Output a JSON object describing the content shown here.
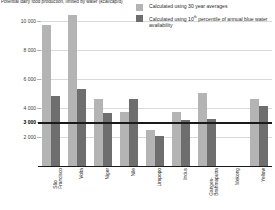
{
  "chart_data": {
    "type": "bar",
    "title": "Potential dairy food production, limited by water (kcal/cap/d)",
    "xlabel": "",
    "ylabel": "",
    "ylim": [
      0,
      10400
    ],
    "grid": true,
    "legend_position": "top-right",
    "emphasis_line": {
      "value": 3000,
      "label": "3 000"
    },
    "ytick_labels": [
      "10 000",
      "8 000",
      "6 000",
      "4 000",
      "3 000",
      "2 000"
    ],
    "ytick_values": [
      10000,
      8000,
      6000,
      4000,
      3000,
      2000
    ],
    "categories": [
      "São\nFrancisco",
      "Volta",
      "Niger",
      "Nile",
      "Limpopo",
      "Indus",
      "Ganges-\nBrahmaputra",
      "Mekong",
      "Yellow"
    ],
    "series": [
      {
        "name": "Calculated using 30 year averages",
        "color": "#b4b4b4",
        "values": [
          9700,
          11200,
          4600,
          3750,
          2450,
          3700,
          5000,
          0,
          4650
        ]
      },
      {
        "name": "Calculated using 10th percentile of annual blue water availability",
        "color": "#6e6e6e",
        "values": [
          4800,
          5300,
          3650,
          4650,
          2050,
          3150,
          3250,
          0,
          4150
        ]
      }
    ]
  },
  "legend": {
    "items": [
      {
        "label": "Calculated using 30 year averages",
        "color": "#b4b4b4"
      },
      {
        "label_pre": "Calculated using 10",
        "label_sup": "th",
        "label_post": " percentile of annual blue water availability",
        "color": "#6e6e6e"
      }
    ]
  },
  "colors": {
    "series_a": "#b4b4b4",
    "series_b": "#6e6e6e",
    "gridline": "#d9d9d9",
    "axis": "#1a1a1a",
    "text": "#2b2b2b",
    "background": "#ffffff"
  }
}
